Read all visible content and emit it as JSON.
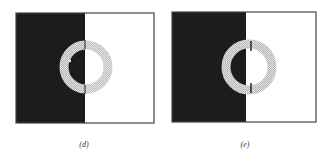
{
  "figure": {
    "panels": [
      {
        "id": "d",
        "label": "(d)",
        "left_fill": "#1c1c1c",
        "right_fill": "#ffffff",
        "ring_fill": "#cfcfcf",
        "frame_color": "#444444",
        "marker": "dot",
        "description": "Stippled ring over a black/white split; inner disc takes the opposite shades"
      },
      {
        "id": "e",
        "label": "(e)",
        "left_fill": "#1c1c1c",
        "right_fill": "#ffffff",
        "ring_fill": "#cfcfcf",
        "frame_color": "#444444",
        "marker": "tick-marks",
        "description": "Stippled ring over a black/white split, with small tick marks where the ring crosses the boundary"
      }
    ]
  }
}
